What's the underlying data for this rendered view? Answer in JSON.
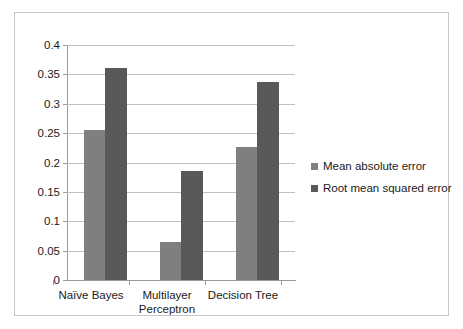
{
  "chart_data": {
    "type": "bar",
    "title": "",
    "subtitle": "",
    "xlabel": "",
    "ylabel": "",
    "categories": [
      "Naïve Bayes",
      "Multilayer Perceptron",
      "Decision Tree"
    ],
    "category_lines": [
      [
        "Naïve Bayes"
      ],
      [
        "Multilayer",
        "Perceptron"
      ],
      [
        "Decision Tree"
      ]
    ],
    "series": [
      {
        "name": "Mean absolute error",
        "color": "#7f7f7f",
        "values": [
          0.255,
          0.065,
          0.227
        ]
      },
      {
        "name": "Root mean squared error",
        "color": "#595959",
        "values": [
          0.361,
          0.185,
          0.337
        ]
      }
    ],
    "ylim": [
      0,
      0.4
    ],
    "yticks": [
      0,
      0.05,
      0.1,
      0.15,
      0.2,
      0.25,
      0.3,
      0.35,
      0.4
    ],
    "ytick_labels": [
      "0",
      "0.05",
      "0.1",
      "0.15",
      "0.2",
      "0.25",
      "0.3",
      "0.35",
      "0.4"
    ],
    "grid": "horizontal",
    "legend_position": "right",
    "legend_entries": [
      "Mean absolute error",
      "Root mean squared error"
    ],
    "annotations": [],
    "colors": {
      "background": "#ffffff",
      "frame_border": "#c9c9c9",
      "gridline": "#c0c0c0",
      "axis_line": "#9a9a9a",
      "text": "#1a1a1a"
    }
  }
}
